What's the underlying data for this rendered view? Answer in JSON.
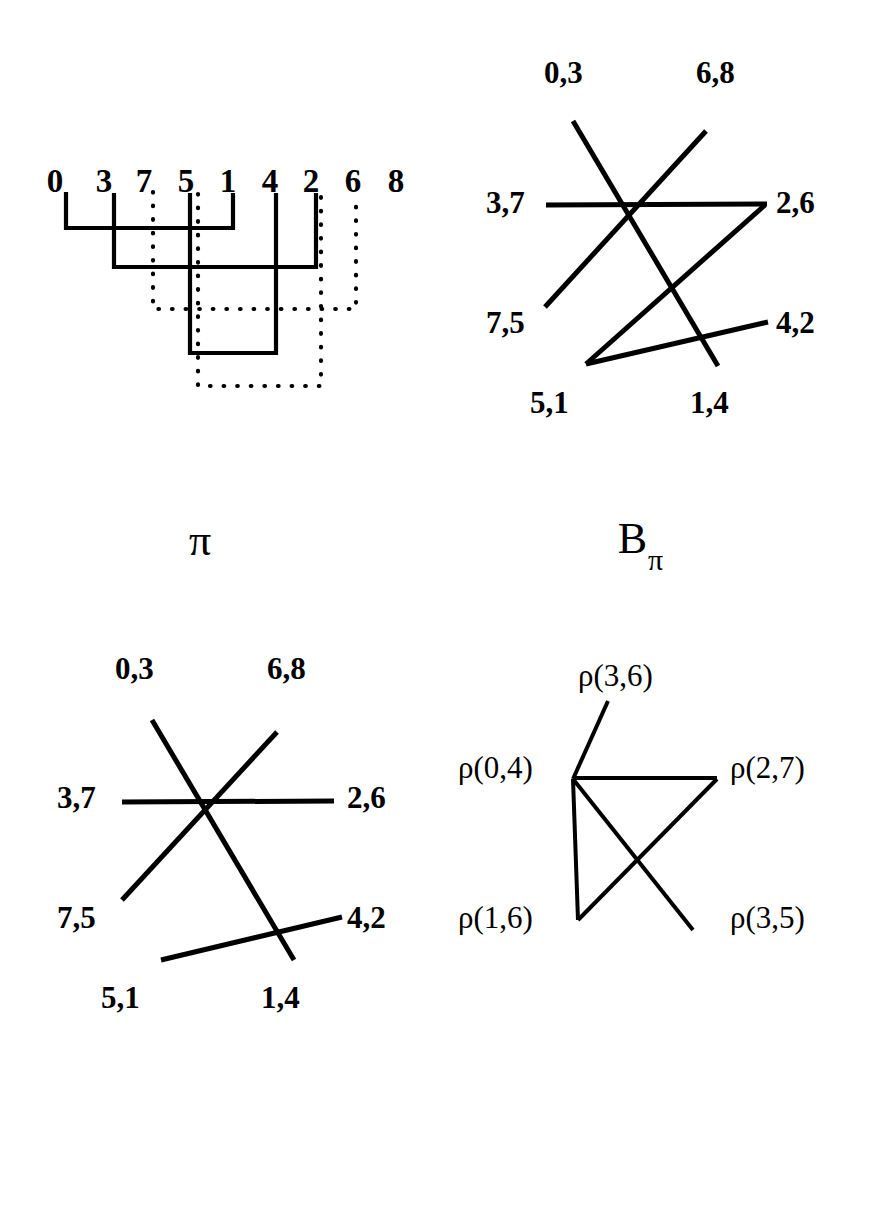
{
  "figure": {
    "background": "#ffffff",
    "ink": "#000000"
  },
  "panels": {
    "pi": {
      "caption": "π",
      "caption_sub": "",
      "sequence": [
        "0",
        "3",
        "7",
        "5",
        "1",
        "4",
        "2",
        "6",
        "8"
      ],
      "arcs": [
        {
          "from": "0",
          "to": "1",
          "style": "solid"
        },
        {
          "from": "3",
          "to": "2",
          "style": "solid"
        },
        {
          "from": "7",
          "to": "6",
          "style": "dotted"
        },
        {
          "from": "5",
          "to": "4",
          "style": "solid"
        },
        {
          "from": "5",
          "to": "2",
          "style": "dotted"
        }
      ]
    },
    "b_pi": {
      "caption": "B",
      "caption_sub": "π",
      "nodes": [
        {
          "id": "n03",
          "label": "0,3",
          "pos": "top-left"
        },
        {
          "id": "n68",
          "label": "6,8",
          "pos": "top-right"
        },
        {
          "id": "n37",
          "label": "3,7",
          "pos": "mid-left"
        },
        {
          "id": "n26",
          "label": "2,6",
          "pos": "mid-right"
        },
        {
          "id": "n75",
          "label": "7,5",
          "pos": "low-left"
        },
        {
          "id": "n42",
          "label": "4,2",
          "pos": "low-right"
        },
        {
          "id": "n51",
          "label": "5,1",
          "pos": "bottom-left"
        },
        {
          "id": "n14",
          "label": "1,4",
          "pos": "bottom-right"
        }
      ],
      "edges": [
        {
          "from": "3,7",
          "to": "2,6"
        },
        {
          "from": "0,3",
          "to": "1,4"
        },
        {
          "from": "6,8",
          "to": "7,5"
        },
        {
          "from": "5,1",
          "to": "2,6"
        },
        {
          "from": "5,1",
          "to": "4,2"
        }
      ]
    },
    "m": {
      "caption": "M",
      "caption_sub": "",
      "nodes": [
        {
          "id": "n03",
          "label": "0,3",
          "pos": "top-left"
        },
        {
          "id": "n68",
          "label": "6,8",
          "pos": "top-right"
        },
        {
          "id": "n37",
          "label": "3,7",
          "pos": "mid-left"
        },
        {
          "id": "n26",
          "label": "2,6",
          "pos": "mid-right"
        },
        {
          "id": "n75",
          "label": "7,5",
          "pos": "low-left"
        },
        {
          "id": "n42",
          "label": "4,2",
          "pos": "low-right"
        },
        {
          "id": "n51",
          "label": "5,1",
          "pos": "bottom-left"
        },
        {
          "id": "n14",
          "label": "1,4",
          "pos": "bottom-right"
        }
      ],
      "edges": [
        {
          "from": "3,7",
          "to": "2,6"
        },
        {
          "from": "0,3",
          "to": "1,4"
        },
        {
          "from": "6,8",
          "to": "7,5"
        },
        {
          "from": "5,1",
          "to": "4,2"
        }
      ]
    },
    "i_m": {
      "caption": "I",
      "caption_sub": "M",
      "nodes": [
        {
          "id": "r36",
          "label": "ρ(3,6)",
          "pos": "top"
        },
        {
          "id": "r04",
          "label": "ρ(0,4)",
          "pos": "mid-left"
        },
        {
          "id": "r27",
          "label": "ρ(2,7)",
          "pos": "mid-right"
        },
        {
          "id": "r16",
          "label": "ρ(1,6)",
          "pos": "bottom-left"
        },
        {
          "id": "r35",
          "label": "ρ(3,5)",
          "pos": "bottom-right"
        }
      ],
      "edges": [
        {
          "from": "ρ(0,4)",
          "to": "ρ(3,6)"
        },
        {
          "from": "ρ(0,4)",
          "to": "ρ(2,7)"
        },
        {
          "from": "ρ(0,4)",
          "to": "ρ(1,6)"
        },
        {
          "from": "ρ(0,4)",
          "to": "ρ(3,5)"
        },
        {
          "from": "ρ(1,6)",
          "to": "ρ(2,7)"
        }
      ]
    }
  }
}
